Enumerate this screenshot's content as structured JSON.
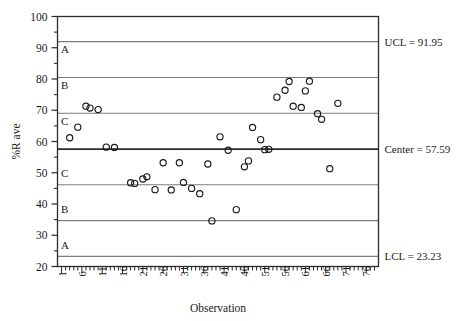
{
  "chart_data": {
    "type": "scatter",
    "title": "",
    "subtitle": "",
    "xlabel": "Observation",
    "ylabel": "%R ave",
    "xlim": [
      0,
      79
    ],
    "ylim": [
      20,
      100
    ],
    "grid": false,
    "legend_position": "none",
    "y_ticks_major": [
      20,
      30,
      40,
      50,
      60,
      70,
      80,
      90,
      100
    ],
    "y_ticks_minor": [
      25,
      35,
      45,
      55,
      65,
      75,
      85,
      95
    ],
    "x_ticks_labeled": [
      1,
      6,
      11,
      16,
      21,
      26,
      31,
      36,
      41,
      46,
      51,
      56,
      61,
      66,
      71,
      76
    ],
    "x_tick_step_minor": 1,
    "control_limits": {
      "ucl": 91.95,
      "center": 57.59,
      "lcl": 23.23,
      "sigma": 11.4533,
      "zone_boundaries": [
        91.95,
        80.5,
        69.04,
        57.59,
        46.14,
        34.68,
        23.23
      ]
    },
    "annotations": [
      {
        "name": "ucl-annotation",
        "text": "UCL = 91.95",
        "y": 91.95
      },
      {
        "name": "center-annotation",
        "text": "Center = 57.59",
        "y": 57.59
      },
      {
        "name": "lcl-annotation",
        "text": "LCL = 23.23",
        "y": 23.23
      }
    ],
    "zone_labels": [
      {
        "text": "A",
        "y": 89.5
      },
      {
        "text": "B",
        "y": 78.0
      },
      {
        "text": "C",
        "y": 66.5
      },
      {
        "text": "C",
        "y": 50.0
      },
      {
        "text": "B",
        "y": 38.5
      },
      {
        "text": "A",
        "y": 27.0
      }
    ],
    "marker": {
      "shape": "circle-open",
      "size": 3.1,
      "edge_color": "#1a1a1a",
      "face_color": "none"
    },
    "points": [
      {
        "x": 3,
        "y": 61.2
      },
      {
        "x": 5,
        "y": 64.6
      },
      {
        "x": 7,
        "y": 71.3
      },
      {
        "x": 8,
        "y": 70.7
      },
      {
        "x": 10,
        "y": 70.2
      },
      {
        "x": 12,
        "y": 58.2
      },
      {
        "x": 14,
        "y": 58.1
      },
      {
        "x": 18,
        "y": 46.8
      },
      {
        "x": 19,
        "y": 46.6
      },
      {
        "x": 21,
        "y": 48.0
      },
      {
        "x": 22,
        "y": 48.7
      },
      {
        "x": 24,
        "y": 44.6
      },
      {
        "x": 26,
        "y": 53.2
      },
      {
        "x": 28,
        "y": 44.5
      },
      {
        "x": 30,
        "y": 53.2
      },
      {
        "x": 31,
        "y": 46.9
      },
      {
        "x": 33,
        "y": 45.0
      },
      {
        "x": 35,
        "y": 43.3
      },
      {
        "x": 37,
        "y": 52.8
      },
      {
        "x": 38,
        "y": 34.6
      },
      {
        "x": 40,
        "y": 61.5
      },
      {
        "x": 42,
        "y": 57.2
      },
      {
        "x": 44,
        "y": 38.2
      },
      {
        "x": 46,
        "y": 51.9
      },
      {
        "x": 47,
        "y": 53.8
      },
      {
        "x": 48,
        "y": 64.5
      },
      {
        "x": 50,
        "y": 60.6
      },
      {
        "x": 51,
        "y": 57.4
      },
      {
        "x": 52,
        "y": 57.5
      },
      {
        "x": 54,
        "y": 74.2
      },
      {
        "x": 56,
        "y": 76.4
      },
      {
        "x": 57,
        "y": 79.2
      },
      {
        "x": 58,
        "y": 71.3
      },
      {
        "x": 60,
        "y": 70.9
      },
      {
        "x": 61,
        "y": 76.2
      },
      {
        "x": 62,
        "y": 79.3
      },
      {
        "x": 64,
        "y": 68.9
      },
      {
        "x": 65,
        "y": 67.1
      },
      {
        "x": 67,
        "y": 51.3
      },
      {
        "x": 69,
        "y": 72.2
      }
    ]
  }
}
